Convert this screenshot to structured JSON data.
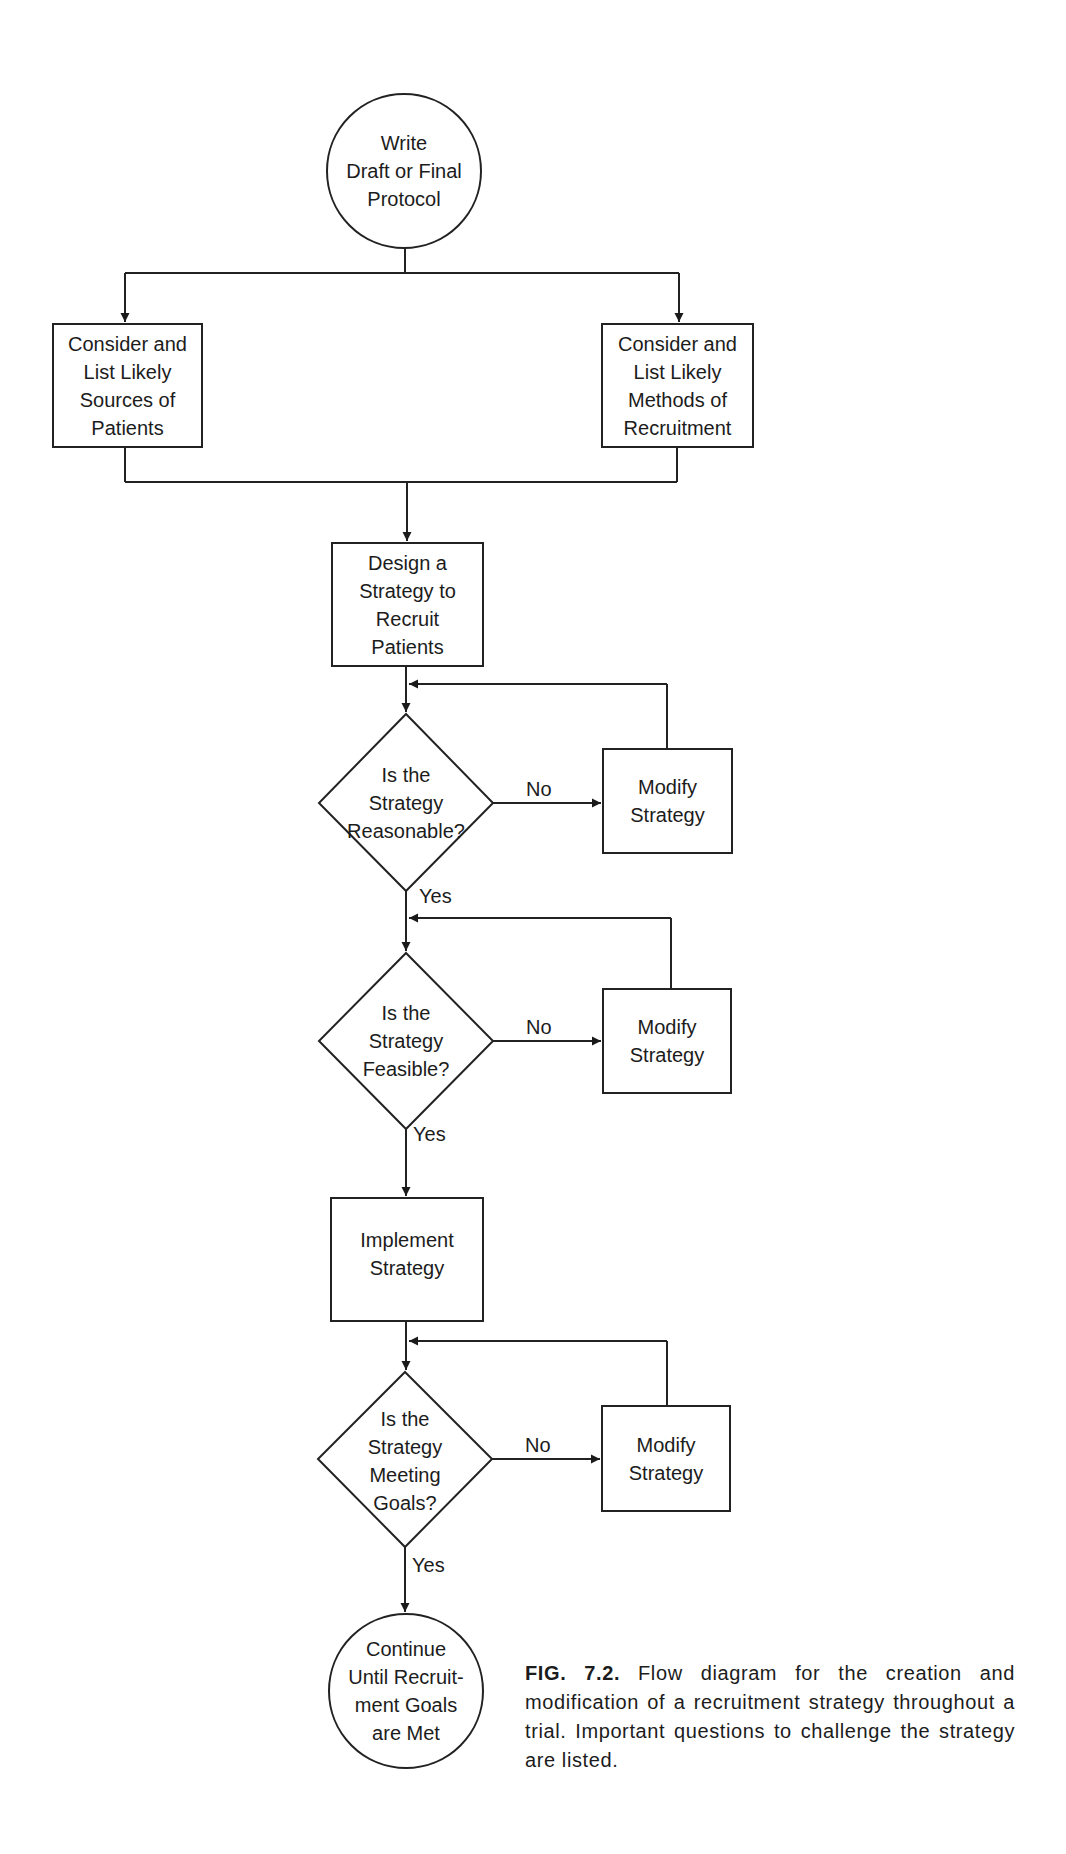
{
  "diagram": {
    "type": "flowchart",
    "nodes": {
      "start": {
        "shape": "circle",
        "lines": [
          "Write",
          "Draft or Final",
          "Protocol"
        ]
      },
      "sources": {
        "shape": "box",
        "lines": [
          "Consider and",
          "List Likely",
          "Sources of",
          "Patients"
        ]
      },
      "methods": {
        "shape": "box",
        "lines": [
          "Consider and",
          "List Likely",
          "Methods of",
          "Recruitment"
        ]
      },
      "design": {
        "shape": "box",
        "lines": [
          "Design a",
          "Strategy to",
          "Recruit",
          "Patients"
        ]
      },
      "q_reasonable": {
        "shape": "diamond",
        "lines": [
          "Is the",
          "Strategy",
          "Reasonable?"
        ]
      },
      "modify_1": {
        "shape": "box",
        "lines": [
          "Modify",
          "Strategy"
        ]
      },
      "q_feasible": {
        "shape": "diamond",
        "lines": [
          "Is the",
          "Strategy",
          "Feasible?"
        ]
      },
      "modify_2": {
        "shape": "box",
        "lines": [
          "Modify",
          "Strategy"
        ]
      },
      "implement": {
        "shape": "box",
        "lines": [
          "Implement",
          "Strategy"
        ]
      },
      "q_goals": {
        "shape": "diamond",
        "lines": [
          "Is the",
          "Strategy",
          "Meeting",
          "Goals?"
        ]
      },
      "modify_3": {
        "shape": "box",
        "lines": [
          "Modify",
          "Strategy"
        ]
      },
      "end": {
        "shape": "circle",
        "lines": [
          "Continue",
          "Until Recruit-",
          "ment Goals",
          "are Met"
        ]
      }
    },
    "edge_labels": {
      "no": "No",
      "yes": "Yes"
    },
    "edges": [
      {
        "from": "start",
        "to": "sources"
      },
      {
        "from": "start",
        "to": "methods"
      },
      {
        "from": "sources",
        "to": "design"
      },
      {
        "from": "methods",
        "to": "design"
      },
      {
        "from": "design",
        "to": "q_reasonable"
      },
      {
        "from": "q_reasonable",
        "to": "modify_1",
        "label": "No"
      },
      {
        "from": "modify_1",
        "to": "q_reasonable"
      },
      {
        "from": "q_reasonable",
        "to": "q_feasible",
        "label": "Yes"
      },
      {
        "from": "q_feasible",
        "to": "modify_2",
        "label": "No"
      },
      {
        "from": "modify_2",
        "to": "q_feasible"
      },
      {
        "from": "q_feasible",
        "to": "implement",
        "label": "Yes"
      },
      {
        "from": "implement",
        "to": "q_goals"
      },
      {
        "from": "q_goals",
        "to": "modify_3",
        "label": "No"
      },
      {
        "from": "modify_3",
        "to": "q_goals"
      },
      {
        "from": "q_goals",
        "to": "end",
        "label": "Yes"
      }
    ]
  },
  "caption": {
    "figure_number": "FIG. 7.2.",
    "text": "Flow diagram for the creation and modification of a recruitment strategy throughout a trial. Important questions to challenge the strategy are listed."
  },
  "colors": {
    "line": "#222222",
    "text": "#1c1c1c",
    "background": "#ffffff"
  }
}
